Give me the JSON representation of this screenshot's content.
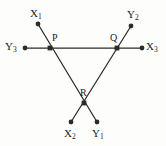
{
  "figure": {
    "type": "geometry-line-diagram",
    "background_color": "#fdfdfc",
    "stroke_color": "#2b2b2b",
    "label_color": "#1a1a1a",
    "lines": [
      {
        "name": "line-Y3-X3",
        "orientation": "horizontal",
        "from_label": "Y3",
        "to_label": "X3",
        "from": [
          25,
          48
        ],
        "to": [
          142,
          48
        ]
      },
      {
        "name": "line-X1-Y1",
        "orientation": "diagonal-down-right",
        "from_label": "X1",
        "to_label": "Y1",
        "from": [
          38,
          24
        ],
        "to": [
          97,
          122
        ]
      },
      {
        "name": "line-Y2-X2",
        "orientation": "diagonal-down-left",
        "from_label": "Y2",
        "to_label": "X2",
        "from": [
          131,
          26
        ],
        "to": [
          71,
          122
        ]
      }
    ],
    "endpoints": [
      {
        "name": "endpoint-X1",
        "label_base": "X",
        "label_sub": "1",
        "dot": [
          38,
          24
        ],
        "label_pos": [
          30,
          8
        ],
        "label_align": "left"
      },
      {
        "name": "endpoint-Y2",
        "label_base": "Y",
        "label_sub": "2",
        "dot": [
          131,
          26
        ],
        "label_pos": [
          127,
          9
        ],
        "label_align": "left"
      },
      {
        "name": "endpoint-Y3",
        "label_base": "Y",
        "label_sub": "3",
        "dot": [
          25,
          48
        ],
        "label_pos": [
          5,
          41
        ],
        "label_align": "left"
      },
      {
        "name": "endpoint-X3",
        "label_base": "X",
        "label_sub": "3",
        "dot": [
          142,
          48
        ],
        "label_pos": [
          146,
          41
        ],
        "label_align": "left"
      },
      {
        "name": "endpoint-X2",
        "label_base": "X",
        "label_sub": "2",
        "dot": [
          71,
          122
        ],
        "label_pos": [
          64,
          128
        ],
        "label_align": "left"
      },
      {
        "name": "endpoint-Y1",
        "label_base": "Y",
        "label_sub": "1",
        "dot": [
          97,
          122
        ],
        "label_pos": [
          92,
          128
        ],
        "label_align": "left"
      }
    ],
    "intersections": [
      {
        "name": "intersection-P",
        "label": "P",
        "dot": [
          50,
          48
        ],
        "label_pos": [
          52,
          33
        ]
      },
      {
        "name": "intersection-Q",
        "label": "Q",
        "dot": [
          117,
          48
        ],
        "label_pos": [
          110,
          33
        ]
      },
      {
        "name": "intersection-R",
        "label": "R",
        "dot": [
          84,
          103
        ],
        "label_pos": [
          80,
          88
        ]
      }
    ]
  }
}
